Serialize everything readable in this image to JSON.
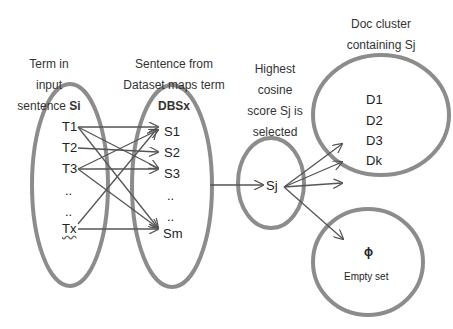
{
  "labels": {
    "term_in_input": {
      "line1": "Term in",
      "line2": "input",
      "line3_pre": "sentence ",
      "line3_bold": "Si"
    },
    "sentence_from_dataset": {
      "line1": "Sentence from",
      "line2": "Dataset maps term",
      "line3_bold": "DBSx"
    },
    "highest_cosine": {
      "line1": "Highest",
      "line2": "cosine",
      "line3": "score Sj is",
      "line4": "selected"
    },
    "doc_cluster": {
      "line1": "Doc cluster",
      "line2": "containing Sj"
    }
  },
  "terms": [
    "T1",
    "T2",
    "T3",
    "..",
    "..",
    "Tx"
  ],
  "sentences": [
    "S1",
    "S2",
    "S3",
    "..",
    "..",
    "Sm"
  ],
  "selected": "Sj",
  "documents": [
    "D1",
    "D2",
    "D3",
    "Dk"
  ],
  "empty_set": {
    "symbol": "ϕ",
    "label": "Empty set"
  },
  "colors": {
    "ellipse_stroke": "#8c8c8c",
    "arrow_stroke": "#555555",
    "text": "#222222"
  },
  "edges": [
    [
      "T1",
      "S1"
    ],
    [
      "T1",
      "S3"
    ],
    [
      "T1",
      "Sm"
    ],
    [
      "T2",
      "S2"
    ],
    [
      "T3",
      "S1"
    ],
    [
      "T3",
      "S3"
    ],
    [
      "T3",
      "Sm"
    ],
    [
      "Tx",
      "Sm"
    ],
    [
      "Tx",
      "S1"
    ],
    [
      "DBSx",
      "Sj"
    ],
    [
      "Sj",
      "D3"
    ],
    [
      "Sj",
      "Dk"
    ],
    [
      "Sj",
      "D-cluster"
    ],
    [
      "Sj",
      "Empty set"
    ]
  ]
}
